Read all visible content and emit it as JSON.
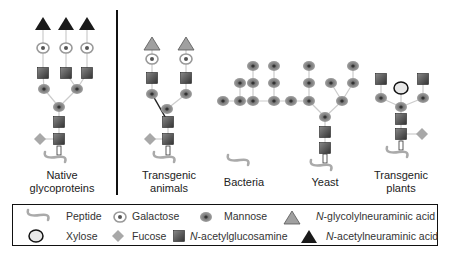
{
  "groups": [
    {
      "label_line1": "Native",
      "label_line2": "glycoproteins"
    },
    {
      "label_line1": "Transgenic",
      "label_line2": "animals"
    },
    {
      "label_line1": "Bacteria",
      "label_line2": ""
    },
    {
      "label_line1": "Yeast",
      "label_line2": ""
    },
    {
      "label_line1": "Transgenic",
      "label_line2": "plants"
    }
  ],
  "legend": {
    "peptide": "Peptide",
    "galactose": "Galactose",
    "mannose": "Mannose",
    "neugc_prefix": "N",
    "neugc": "-glycolylneuraminic acid",
    "xylose": "Xylose",
    "fucose": "Fucose",
    "glcnac_prefix": "N",
    "glcnac": "-acetylglucosamine",
    "neuac_prefix": "N",
    "neuac": "-acetylneuraminic acid"
  },
  "colors": {
    "neuac": "#1a1a1a",
    "neugc": "#9a9a9a",
    "mannose": "#8c8c8c",
    "glcnac": "#555555",
    "fucose": "#a8a8a8",
    "peptide": "#aaaaaa",
    "divider": "#111111"
  }
}
